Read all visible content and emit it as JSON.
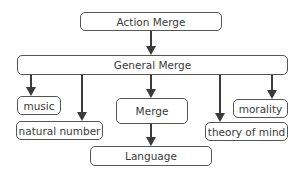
{
  "diagram": {
    "nodes": [
      {
        "id": "action_merge",
        "label": "Action Merge"
      },
      {
        "id": "general_merge",
        "label": "General Merge"
      },
      {
        "id": "music",
        "label": "music"
      },
      {
        "id": "natural_number",
        "label": "natural number"
      },
      {
        "id": "merge",
        "label": "Merge"
      },
      {
        "id": "theory_of_mind",
        "label": "theory of mind"
      },
      {
        "id": "morality",
        "label": "morality"
      },
      {
        "id": "language",
        "label": "Language"
      }
    ],
    "edges": [
      {
        "from": "action_merge",
        "to": "general_merge"
      },
      {
        "from": "general_merge",
        "to": "music"
      },
      {
        "from": "general_merge",
        "to": "natural_number"
      },
      {
        "from": "general_merge",
        "to": "merge"
      },
      {
        "from": "general_merge",
        "to": "theory_of_mind"
      },
      {
        "from": "general_merge",
        "to": "morality"
      },
      {
        "from": "merge",
        "to": "language"
      }
    ],
    "colors": {
      "stroke": "#555555",
      "arrow": "#3a3a3a",
      "text": "#3a3a3a"
    }
  }
}
